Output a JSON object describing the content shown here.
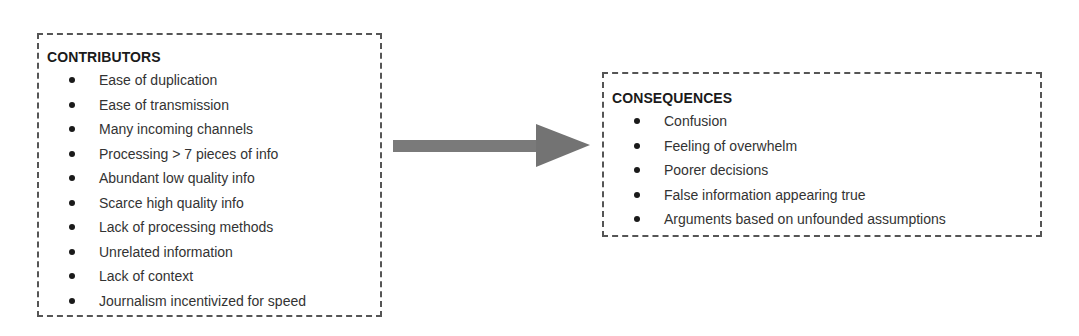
{
  "contributors": {
    "title": "CONTRIBUTORS",
    "items": [
      {
        "label": "Ease of duplication"
      },
      {
        "label": "Ease of transmission"
      },
      {
        "label": "Many incoming channels"
      },
      {
        "label": "Processing > 7 pieces of info"
      },
      {
        "label": "Abundant low quality info"
      },
      {
        "label": "Scarce high quality info"
      },
      {
        "label": "Lack of processing methods"
      },
      {
        "label": "Unrelated information"
      },
      {
        "label": "Lack of context"
      },
      {
        "label": "Journalism incentivized for speed"
      }
    ]
  },
  "arrow": {
    "icon": "right-arrow-icon",
    "color": "#7a7a7a"
  },
  "consequences": {
    "title": "CONSEQUENCES",
    "items": [
      {
        "label": "Confusion"
      },
      {
        "label": "Feeling of overwhelm"
      },
      {
        "label": "Poorer decisions"
      },
      {
        "label": "False information appearing true"
      },
      {
        "label": "Arguments based on unfounded assumptions"
      }
    ]
  }
}
